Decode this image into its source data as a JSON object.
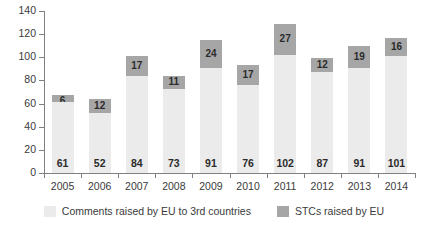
{
  "chart_data": {
    "type": "bar",
    "stacked": true,
    "title": "",
    "subtitle": "",
    "xlabel": "",
    "ylabel": "",
    "ylim": [
      0,
      140
    ],
    "yticks": [
      0,
      20,
      40,
      60,
      80,
      100,
      120,
      140
    ],
    "grid": false,
    "legend_position": "bottom",
    "categories": [
      "2005",
      "2006",
      "2007",
      "2008",
      "2009",
      "2010",
      "2011",
      "2012",
      "2013",
      "2014"
    ],
    "series": [
      {
        "name": "Comments raised by EU to 3rd countries",
        "color": "#ebebeb",
        "values": [
          61,
          52,
          84,
          73,
          91,
          76,
          102,
          87,
          91,
          101
        ]
      },
      {
        "name": "STCs raised by EU",
        "color": "#a6a6a6",
        "values": [
          6,
          12,
          17,
          11,
          24,
          17,
          27,
          12,
          19,
          16
        ]
      }
    ],
    "totals": [
      67,
      64,
      101,
      84,
      115,
      93,
      129,
      99,
      110,
      117
    ]
  },
  "axis": {
    "y_tick_labels": [
      "0",
      "20",
      "40",
      "60",
      "80",
      "100",
      "120",
      "140"
    ],
    "x_tick_labels": [
      "2005",
      "2006",
      "2007",
      "2008",
      "2009",
      "2010",
      "2011",
      "2012",
      "2013",
      "2014"
    ]
  },
  "legend": {
    "items": [
      {
        "label": "Comments raised by EU to 3rd countries",
        "color": "#ebebeb"
      },
      {
        "label": "STCs raised by EU",
        "color": "#a6a6a6"
      }
    ]
  },
  "colors": {
    "base_series": "#ebebeb",
    "top_series": "#a6a6a6",
    "axis": "#808080",
    "text": "#2b2b2b",
    "background": "#ffffff"
  }
}
